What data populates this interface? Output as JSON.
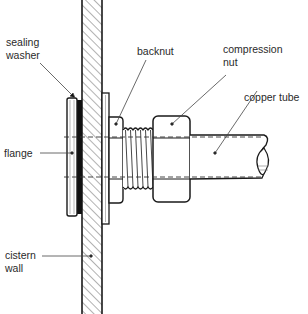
{
  "diagram": {
    "type": "cross-section",
    "labels": {
      "sealing_washer": "sealing\nwasher",
      "flange": "flange",
      "cistern_wall": "cistern\nwall",
      "backnut": "backnut",
      "compression_nut": "compression\nnut",
      "copper_tube": "copper tube"
    },
    "colors": {
      "line": "#1a1a1a",
      "hatch": "#555555",
      "leader": "#444444",
      "background": "#ffffff"
    }
  }
}
